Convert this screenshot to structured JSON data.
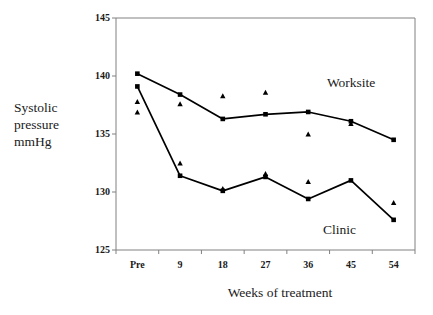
{
  "chart_data": {
    "type": "line",
    "title": "",
    "xlabel": "Weeks of treatment",
    "ylabel": "Systolic pressure mmHg",
    "ylabel_lines": [
      "Systolic",
      "pressure",
      "mmHg"
    ],
    "categories": [
      "Pre",
      "9",
      "18",
      "27",
      "36",
      "45",
      "54"
    ],
    "ylim": [
      125,
      145
    ],
    "yticks": [
      125,
      130,
      135,
      140,
      145
    ],
    "ytick_labels": [
      "125",
      "130",
      "135",
      "140",
      "145"
    ],
    "grid": false,
    "legend_position": "inline-annotations",
    "series": [
      {
        "name": "Worksite",
        "marker": "square",
        "line": true,
        "values": [
          140.2,
          138.4,
          136.3,
          136.7,
          136.9,
          136.1,
          134.5
        ]
      },
      {
        "name": "Clinic",
        "marker": "square",
        "line": true,
        "values": [
          139.1,
          131.4,
          130.1,
          131.3,
          129.4,
          131.0,
          127.6
        ]
      },
      {
        "name": "Worksite triangles",
        "marker": "triangle",
        "line": false,
        "values": [
          137.8,
          137.6,
          138.3,
          138.6,
          135.0,
          135.9,
          null
        ]
      },
      {
        "name": "Clinic triangles",
        "marker": "triangle",
        "line": false,
        "values": [
          136.9,
          132.5,
          130.3,
          131.6,
          130.9,
          null,
          129.1
        ]
      }
    ],
    "annotations": [
      {
        "text": "Worksite",
        "x_category": "45",
        "y_value": 139.3
      },
      {
        "text": "Clinic",
        "x_category": "45",
        "y_value": 126.6
      }
    ],
    "colors": {
      "line": "#000000",
      "marker": "#000000",
      "axis": "#808080",
      "text": "#1a1a1a",
      "background": "#ffffff"
    }
  }
}
